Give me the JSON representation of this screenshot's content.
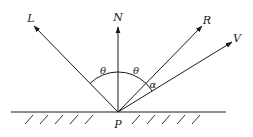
{
  "diagram": {
    "type": "reflection-vectors",
    "point": {
      "label": "P",
      "x": 118,
      "y": 112
    },
    "surface": {
      "x1": 11,
      "x2": 226,
      "y": 112
    },
    "vectors": [
      {
        "id": "L",
        "label": "L",
        "tip": [
          34,
          26
        ],
        "label_pos": [
          31,
          19
        ]
      },
      {
        "id": "N",
        "label": "N",
        "tip": [
          118,
          27
        ],
        "label_pos": [
          118,
          19
        ]
      },
      {
        "id": "R",
        "label": "R",
        "tip": [
          202,
          26
        ],
        "label_pos": [
          207,
          21
        ]
      },
      {
        "id": "V",
        "label": "V",
        "tip": [
          232,
          42
        ],
        "label_pos": [
          237,
          39
        ]
      }
    ],
    "angles": [
      {
        "label": "θ",
        "between": [
          "L",
          "N"
        ],
        "label_pos": [
          103,
          72
        ]
      },
      {
        "label": "θ",
        "between": [
          "N",
          "R"
        ],
        "label_pos": [
          136,
          72
        ]
      },
      {
        "label": "α",
        "between": [
          "R",
          "V"
        ],
        "label_pos": [
          152,
          86
        ]
      }
    ]
  },
  "labels": {
    "L": "L",
    "N": "N",
    "R": "R",
    "V": "V",
    "P": "P",
    "theta_left": "θ",
    "theta_right": "θ",
    "alpha": "α"
  },
  "colors": {
    "ink": "#1a1a1a",
    "background": "#ffffff"
  }
}
